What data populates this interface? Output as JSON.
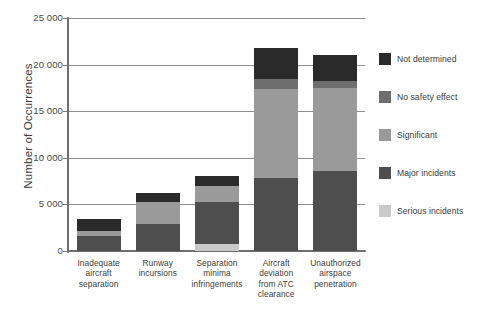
{
  "chart_data": {
    "type": "bar",
    "subtype": "stacked-bar",
    "title": "",
    "subtitle": "",
    "xlabel": "",
    "ylabel": "Number of Occurrences",
    "ylim": [
      0,
      25000
    ],
    "y_ticks": [
      0,
      5000,
      10000,
      15000,
      20000,
      25000
    ],
    "y_tick_labels": [
      "0",
      "5 000",
      "10 000",
      "15 000",
      "20 000",
      "25 000"
    ],
    "grid": "horizontal",
    "legend_position": "right",
    "categories": [
      "Inadequate aircraft separation",
      "Runway incursions",
      "Separation minima infringements",
      "Aircraft deviation from ATC clearance",
      "Unauthorized airspace penetration"
    ],
    "category_lines": [
      [
        "Inadequate",
        "aircraft",
        "separation"
      ],
      [
        "Runway",
        "incursions"
      ],
      [
        "Separation",
        "minima",
        "infringements"
      ],
      [
        "Aircraft",
        "deviation",
        "from ATC",
        "clearance"
      ],
      [
        "Unauthorized",
        "airspace",
        "penetration"
      ]
    ],
    "series": [
      {
        "name": "Serious incidents",
        "color": "#c9c9c9",
        "values": [
          0,
          0,
          800,
          0,
          0
        ]
      },
      {
        "name": "Major incidents",
        "color": "#4e4e4e",
        "values": [
          1600,
          2900,
          4500,
          7800,
          8600
        ]
      },
      {
        "name": "Significant",
        "color": "#9a9a9a",
        "values": [
          500,
          2400,
          1700,
          9600,
          8900
        ]
      },
      {
        "name": "No safety effect",
        "color": "#6e6e6e",
        "values": [
          0,
          0,
          0,
          1100,
          700
        ]
      },
      {
        "name": "Not determined",
        "color": "#2a2a2a",
        "values": [
          1300,
          900,
          1000,
          3300,
          2800
        ]
      }
    ],
    "totals": [
      3400,
      6200,
      8000,
      21800,
      21000
    ]
  },
  "legend": {
    "items": [
      {
        "label": "Not determined",
        "color": "#2a2a2a"
      },
      {
        "label": "No safety effect",
        "color": "#6e6e6e"
      },
      {
        "label": "Significant",
        "color": "#9a9a9a"
      },
      {
        "label": "Major incidents",
        "color": "#4e4e4e"
      },
      {
        "label": "Serious incidents",
        "color": "#c9c9c9"
      }
    ]
  },
  "axes": {
    "y_title": "Number of Occurrences",
    "tick_labels": [
      "25 000",
      "20 000",
      "15 000",
      "10 000",
      "5 000",
      "0"
    ]
  },
  "colors": {
    "axis": "#6f6f6f",
    "gridline": "#8f8f8f",
    "text": "#3b3b3b",
    "background": "#ffffff"
  }
}
